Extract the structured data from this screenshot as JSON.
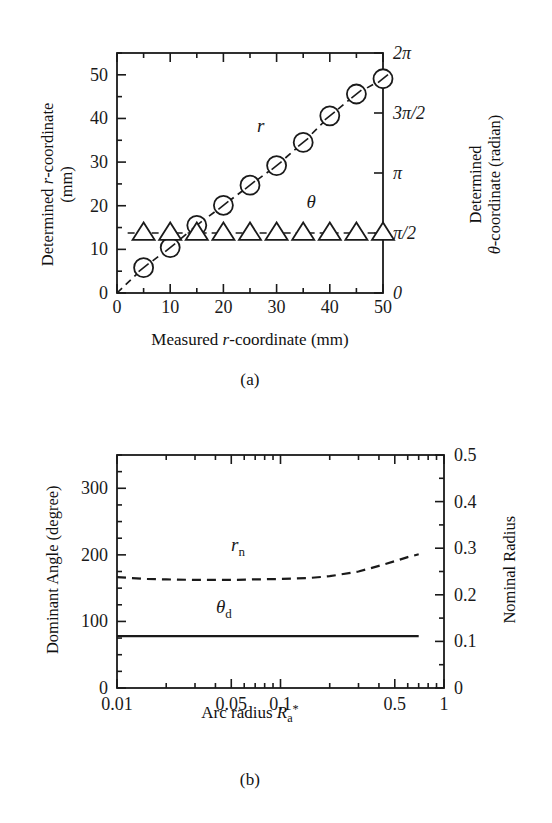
{
  "figure": {
    "panels": [
      {
        "id": "a",
        "caption": "(a)",
        "xlabel_parts": {
          "pre": "Measured ",
          "italic": "r",
          "post": "-coordinate (mm)"
        },
        "ylabel_left_line1_pre": "Determined ",
        "ylabel_left_line1_italic": "r",
        "ylabel_left_line1_post": "-coordinate",
        "ylabel_left_line2": "(mm)",
        "ylabel_right_line1": "Determined",
        "ylabel_right_line2_italic": "θ",
        "ylabel_right_line2_post": "-coordinate (radian)",
        "series_label_r": "r",
        "series_label_theta": "θ",
        "xticks": [
          "0",
          "10",
          "20",
          "30",
          "40",
          "50"
        ],
        "yticks_left": [
          "0",
          "10",
          "20",
          "30",
          "40",
          "50"
        ],
        "yticks_right": [
          "0",
          "π/2",
          "π",
          "3π/2",
          "2π"
        ]
      },
      {
        "id": "b",
        "caption": "(b)",
        "xlabel_pre": "Arc radius ",
        "xlabel_italic": "R",
        "xlabel_sub": "a",
        "xlabel_sup": "*",
        "ylabel_left": "Dominant Angle (degree)",
        "ylabel_right": "Nominal Radius",
        "series_label_rn_italic": "r",
        "series_label_rn_sub": "n",
        "series_label_td_italic": "θ",
        "series_label_td_sub": "d",
        "xticks": [
          "0.01",
          "0.05",
          "0.1",
          "0.5",
          "1"
        ],
        "yticks_left": [
          "0",
          "100",
          "200",
          "300"
        ],
        "yticks_right": [
          "0",
          "0.1",
          "0.2",
          "0.3",
          "0.4",
          "0.5"
        ]
      }
    ]
  },
  "chart_data": [
    {
      "type": "scatter",
      "panel": "a",
      "title": "",
      "xlabel": "Measured r-coordinate (mm)",
      "ylabel": "Determined r-coordinate (mm)",
      "ylabel_right": "Determined θ-coordinate (radian)",
      "xlim": [
        0,
        50
      ],
      "ylim_left": [
        0,
        55
      ],
      "ylim_right": [
        0,
        6.283185
      ],
      "grid": false,
      "legend": "inline-annotations",
      "xticks": [
        0,
        10,
        20,
        30,
        40,
        50
      ],
      "xticks_minor_step": 5,
      "yticks_left": [
        0,
        10,
        20,
        30,
        40,
        50
      ],
      "yticks_left_minor_step": 5,
      "yticks_right_values": [
        0,
        1.570796,
        3.141593,
        4.712389,
        6.283185
      ],
      "yticks_right_labels": [
        "0",
        "π/2",
        "π",
        "3π/2",
        "2π"
      ],
      "series": [
        {
          "name": "r",
          "marker": "circle",
          "axis": "left",
          "line": "dashed",
          "x": [
            5,
            10,
            15,
            20,
            25,
            30,
            35,
            40,
            45,
            50
          ],
          "y": [
            5.8,
            10.4,
            15.5,
            20.1,
            24.7,
            29.2,
            34.5,
            40.6,
            45.6,
            49.1
          ]
        },
        {
          "name": "θ",
          "marker": "triangle",
          "axis": "right",
          "line": "dashed",
          "x": [
            5,
            10,
            15,
            20,
            25,
            30,
            35,
            40,
            45,
            50
          ],
          "y_radian": [
            1.571,
            1.571,
            1.571,
            1.571,
            1.571,
            1.571,
            1.571,
            1.571,
            1.571,
            1.571
          ],
          "y_left_equiv": [
            13.7,
            13.7,
            13.7,
            13.7,
            13.7,
            13.7,
            13.7,
            13.7,
            13.7,
            13.7
          ]
        }
      ],
      "annotations": [
        {
          "text": "r",
          "x": 27,
          "y": 37,
          "axis": "left"
        },
        {
          "text": "θ",
          "x": 36.5,
          "y": 19.5,
          "axis": "left"
        }
      ]
    },
    {
      "type": "line",
      "panel": "b",
      "title": "",
      "xlabel": "Arc radius R_a*",
      "ylabel": "Dominant Angle (degree)",
      "ylabel_right": "Nominal Radius",
      "xscale": "log",
      "xlim": [
        0.01,
        1
      ],
      "ylim_left": [
        0,
        350
      ],
      "ylim_right": [
        0,
        0.5
      ],
      "grid": false,
      "xticks": [
        0.01,
        0.05,
        0.1,
        0.5,
        1
      ],
      "yticks_left": [
        0,
        100,
        200,
        300
      ],
      "yticks_left_minor_step": 25,
      "yticks_right": [
        0,
        0.1,
        0.2,
        0.3,
        0.4,
        0.5
      ],
      "series": [
        {
          "name": "r_n",
          "axis": "right",
          "line": "dashed",
          "x": [
            0.01,
            0.015,
            0.02,
            0.03,
            0.05,
            0.07,
            0.1,
            0.15,
            0.2,
            0.3,
            0.4,
            0.5,
            0.6,
            0.7
          ],
          "y": [
            0.238,
            0.234,
            0.233,
            0.232,
            0.232,
            0.233,
            0.234,
            0.236,
            0.24,
            0.25,
            0.262,
            0.272,
            0.281,
            0.287
          ]
        },
        {
          "name": "θ_d",
          "axis": "left",
          "line": "solid",
          "x": [
            0.01,
            0.05,
            0.1,
            0.3,
            0.5,
            0.7
          ],
          "y": [
            78,
            78,
            78,
            78,
            78,
            78
          ]
        }
      ],
      "annotations": [
        {
          "text": "r_n",
          "x": 0.055,
          "y_right": 0.293
        },
        {
          "text": "θ_d",
          "x": 0.045,
          "y_left": 112
        }
      ]
    }
  ],
  "style": {
    "axis_color": "#1a1a1a",
    "marker_color": "#1a1a1a",
    "background": "#ffffff"
  }
}
